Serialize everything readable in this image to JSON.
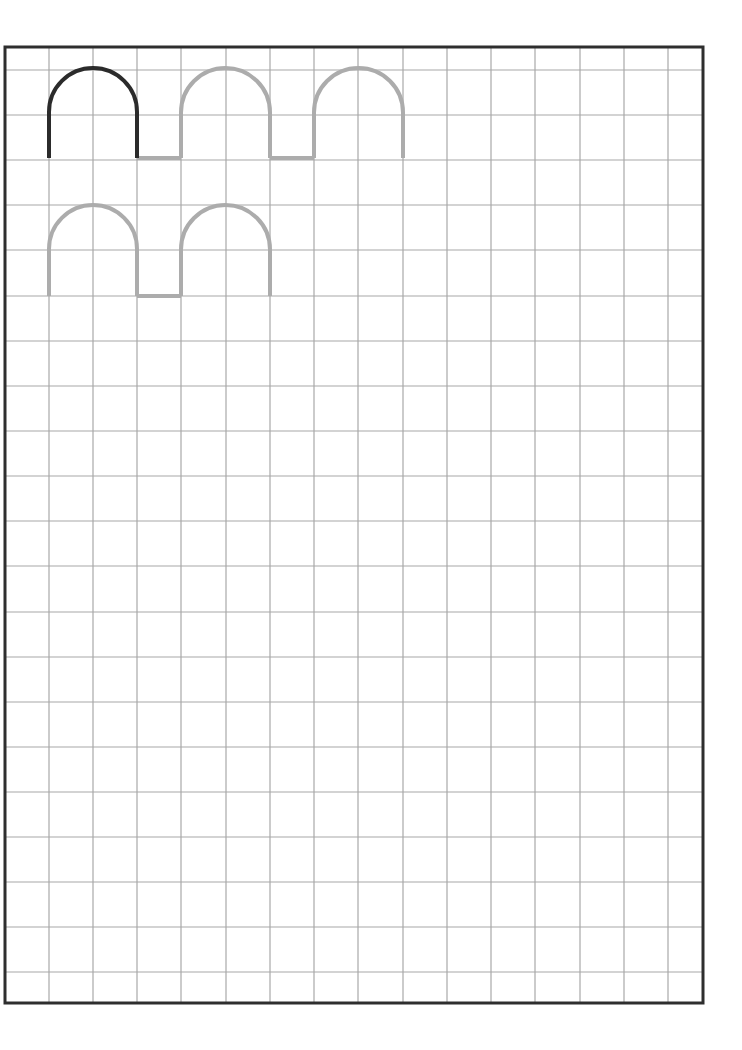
{
  "worksheet": {
    "type": "handwriting-tracing-grid",
    "frame": {
      "x1": 5,
      "y1": 47,
      "x2": 703,
      "y2": 1003
    },
    "grid": {
      "vertical_lines_x": [
        49,
        93,
        137,
        181,
        226,
        270,
        314,
        358,
        403,
        447,
        491,
        535,
        580,
        624,
        668
      ],
      "horizontal_lines_y": [
        70,
        115,
        160,
        205,
        250,
        296,
        341,
        386,
        431,
        476,
        521,
        566,
        612,
        657,
        702,
        747,
        792,
        837,
        882,
        927,
        972
      ],
      "color": "#a8a8a8"
    },
    "colors": {
      "frame": "#2e2e2e",
      "example_stroke": "#2b2b2b",
      "trace_stroke": "#acacac"
    },
    "rows": [
      {
        "arches": [
          {
            "x_left": 49,
            "x_right": 137,
            "top": 68,
            "bottom": 158,
            "style": "example"
          },
          {
            "x_left": 181,
            "x_right": 270,
            "top": 68,
            "bottom": 158,
            "style": "trace"
          },
          {
            "x_left": 314,
            "x_right": 403,
            "top": 68,
            "bottom": 158,
            "style": "trace"
          }
        ],
        "connectors": [
          {
            "x1": 137,
            "x2": 181,
            "y": 158,
            "style": "trace"
          },
          {
            "x1": 270,
            "x2": 314,
            "y": 158,
            "style": "trace"
          }
        ]
      },
      {
        "arches": [
          {
            "x_left": 49,
            "x_right": 137,
            "top": 205,
            "bottom": 296,
            "style": "trace"
          },
          {
            "x_left": 181,
            "x_right": 270,
            "top": 205,
            "bottom": 296,
            "style": "trace"
          }
        ],
        "connectors": [
          {
            "x1": 137,
            "x2": 181,
            "y": 296,
            "style": "trace"
          }
        ]
      }
    ]
  }
}
